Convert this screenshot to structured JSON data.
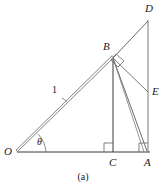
{
  "figure": {
    "caption": "(a)",
    "background_color": "#ffffff",
    "stroke_color": "#3a3a3a",
    "label_color": "#1a1a1a",
    "width": 166,
    "height": 192
  },
  "labels": {
    "point_O": "O",
    "point_A": "A",
    "point_B": "B",
    "point_C": "C",
    "point_D": "D",
    "point_E": "E",
    "angle_theta": "θ",
    "length_OB": "1"
  },
  "geometry": {
    "points": {
      "O": {
        "x": 17,
        "y": 152
      },
      "A": {
        "x": 148,
        "y": 152
      },
      "C": {
        "x": 113,
        "y": 152
      },
      "B": {
        "x": 113,
        "y": 57
      },
      "D": {
        "x": 148,
        "y": 20
      },
      "E": {
        "x": 148,
        "y": 92
      }
    },
    "segments": [
      {
        "name": "O-A-baseline",
        "from": "O",
        "to": "A"
      },
      {
        "name": "O-B-unit-segment",
        "from": "O",
        "to": "B",
        "label": "1",
        "style": "double"
      },
      {
        "name": "B-C-altitude",
        "from": "B",
        "to": "C"
      },
      {
        "name": "B-A",
        "from": "B",
        "to": "A"
      },
      {
        "name": "B-E",
        "from": "B",
        "to": "E"
      },
      {
        "name": "B-D",
        "from": "B",
        "to": "D"
      },
      {
        "name": "D-A-vertical",
        "from": "D",
        "to": "A"
      }
    ],
    "right_angles": [
      {
        "name": "right-angle-at-C",
        "vertex": "C"
      },
      {
        "name": "right-angle-at-A",
        "vertex": "A"
      },
      {
        "name": "right-angle-at-B",
        "vertex": "B"
      }
    ],
    "angles": [
      {
        "name": "angle-theta-at-O",
        "vertex": "O",
        "label": "θ"
      }
    ]
  }
}
